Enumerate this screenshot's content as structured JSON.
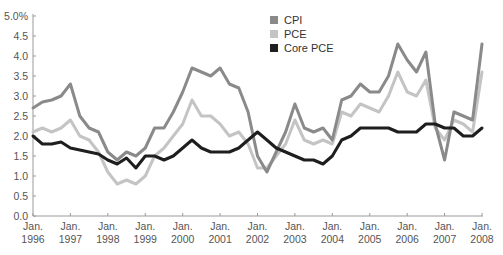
{
  "chart_data": {
    "type": "line",
    "title": "",
    "xlabel": "",
    "ylabel": "",
    "ylim": [
      0,
      5.0
    ],
    "yticks": [
      "0.0",
      "0.5",
      "1.0",
      "1.5",
      "2.0",
      "2.5",
      "3.0",
      "3.5",
      "4.0",
      "4.5",
      "5.0%"
    ],
    "xticks": [
      {
        "line1": "Jan.",
        "line2": "1996"
      },
      {
        "line1": "Jan.",
        "line2": "1997"
      },
      {
        "line1": "Jan.",
        "line2": "1998"
      },
      {
        "line1": "Jan.",
        "line2": "1999"
      },
      {
        "line1": "Jan.",
        "line2": "2000"
      },
      {
        "line1": "Jan.",
        "line2": "2001"
      },
      {
        "line1": "Jan.",
        "line2": "2002"
      },
      {
        "line1": "Jan.",
        "line2": "2003"
      },
      {
        "line1": "Jan.",
        "line2": "2004"
      },
      {
        "line1": "Jan.",
        "line2": "2005"
      },
      {
        "line1": "Jan.",
        "line2": "2006"
      },
      {
        "line1": "Jan.",
        "line2": "2007"
      },
      {
        "line1": "Jan.",
        "line2": "2008"
      }
    ],
    "grid": false,
    "legend_position": "top-center",
    "x": [
      1996.0,
      1996.25,
      1996.5,
      1996.75,
      1997.0,
      1997.25,
      1997.5,
      1997.75,
      1998.0,
      1998.25,
      1998.5,
      1998.75,
      1999.0,
      1999.25,
      1999.5,
      1999.75,
      2000.0,
      2000.25,
      2000.5,
      2000.75,
      2001.0,
      2001.25,
      2001.5,
      2001.75,
      2002.0,
      2002.25,
      2002.5,
      2002.75,
      2003.0,
      2003.25,
      2003.5,
      2003.75,
      2004.0,
      2004.25,
      2004.5,
      2004.75,
      2005.0,
      2005.25,
      2005.5,
      2005.75,
      2006.0,
      2006.25,
      2006.5,
      2006.75,
      2007.0,
      2007.25,
      2007.5,
      2007.75,
      2008.0
    ],
    "series": [
      {
        "name": "CPI",
        "color": "#8a8a8a",
        "values": [
          2.7,
          2.85,
          2.9,
          3.0,
          3.3,
          2.5,
          2.2,
          2.1,
          1.6,
          1.4,
          1.6,
          1.5,
          1.7,
          2.2,
          2.2,
          2.6,
          3.1,
          3.7,
          3.6,
          3.5,
          3.7,
          3.3,
          3.2,
          2.6,
          1.5,
          1.1,
          1.6,
          2.1,
          2.8,
          2.2,
          2.1,
          2.2,
          1.9,
          2.9,
          3.0,
          3.3,
          3.1,
          3.1,
          3.5,
          4.3,
          3.9,
          3.6,
          4.1,
          2.3,
          1.4,
          2.6,
          2.5,
          2.4,
          4.3
        ]
      },
      {
        "name": "PCE",
        "color": "#c4c4c4",
        "values": [
          2.1,
          2.2,
          2.1,
          2.2,
          2.4,
          2.0,
          1.9,
          1.6,
          1.1,
          0.8,
          0.9,
          0.8,
          1.0,
          1.5,
          1.7,
          2.0,
          2.3,
          2.9,
          2.5,
          2.5,
          2.3,
          2.0,
          2.1,
          1.8,
          1.2,
          1.2,
          1.5,
          1.8,
          2.4,
          1.9,
          1.8,
          1.9,
          1.8,
          2.6,
          2.5,
          2.8,
          2.7,
          2.6,
          3.0,
          3.6,
          3.1,
          3.0,
          3.4,
          2.2,
          1.9,
          2.4,
          2.3,
          2.1,
          3.6
        ]
      },
      {
        "name": "Core PCE",
        "color": "#1e1e1e",
        "values": [
          2.0,
          1.8,
          1.8,
          1.85,
          1.7,
          1.65,
          1.6,
          1.55,
          1.4,
          1.3,
          1.45,
          1.2,
          1.5,
          1.5,
          1.4,
          1.5,
          1.7,
          1.9,
          1.7,
          1.6,
          1.6,
          1.6,
          1.7,
          1.9,
          2.1,
          1.9,
          1.7,
          1.6,
          1.5,
          1.4,
          1.4,
          1.3,
          1.5,
          1.9,
          2.0,
          2.2,
          2.2,
          2.2,
          2.2,
          2.1,
          2.1,
          2.1,
          2.3,
          2.3,
          2.2,
          2.2,
          2.0,
          2.0,
          2.2
        ]
      }
    ]
  },
  "legend": {
    "items": [
      {
        "label": "CPI",
        "color": "#8a8a8a"
      },
      {
        "label": "PCE",
        "color": "#c4c4c4"
      },
      {
        "label": "Core PCE",
        "color": "#1e1e1e"
      }
    ]
  }
}
